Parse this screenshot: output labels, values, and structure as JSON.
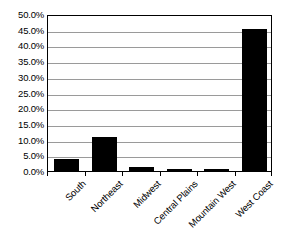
{
  "chart_data": {
    "type": "bar",
    "title": "",
    "xlabel": "",
    "ylabel": "",
    "categories": [
      "South",
      "Northeast",
      "Midwest",
      "Central Plains",
      "Mountain West",
      "West Coast"
    ],
    "values": [
      3.9,
      10.8,
      1.2,
      0.5,
      0.5,
      45.1
    ],
    "value_labels": [
      "3.9%",
      "10.8%",
      "1.2%",
      "0.5%",
      "0.5%",
      "45.1%"
    ],
    "ylim": [
      0.0,
      50.0
    ],
    "ytick_step": 5.0,
    "ytick_labels": [
      "50.0%",
      "45.0%",
      "40.0%",
      "35.0%",
      "30.0%",
      "25.0%",
      "20.0%",
      "15.0%",
      "10.0%",
      "5.0%",
      "0.0%"
    ],
    "ytick_values": [
      50.0,
      45.0,
      40.0,
      35.0,
      30.0,
      25.0,
      20.0,
      15.0,
      10.0,
      5.0,
      0.0
    ],
    "grid": true,
    "legend": false,
    "legend_position": "none",
    "series": [
      {
        "name": "",
        "values": [
          3.9,
          10.8,
          1.2,
          0.5,
          0.5,
          45.1
        ],
        "color": "#000000"
      }
    ],
    "colors": {
      "bar": "#000000",
      "gridline": "#9a9a9a",
      "axis": "#000000",
      "background": "#ffffff",
      "text": "#000000"
    }
  }
}
